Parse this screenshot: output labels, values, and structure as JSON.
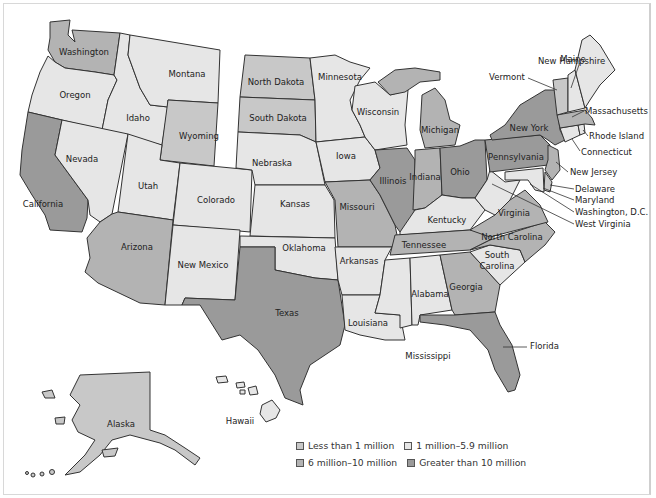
{
  "map": {
    "title": "",
    "colors": {
      "lt1": "#c8c8c8",
      "m1to5": "#e6e6e6",
      "m6to10": "#b3b3b3",
      "gt10": "#9a9a9a",
      "water": "#ffffff",
      "border": "#333333"
    },
    "legend": [
      {
        "key": "lt1",
        "label": "Less than 1 million"
      },
      {
        "key": "m1to5",
        "label": "1 million–5.9 million"
      },
      {
        "key": "m6to10",
        "label": "6 million–10 million"
      },
      {
        "key": "gt10",
        "label": "Greater than 10 million"
      }
    ],
    "states": [
      {
        "name": "Washington",
        "category": "m6to10"
      },
      {
        "name": "Oregon",
        "category": "m1to5"
      },
      {
        "name": "California",
        "category": "gt10"
      },
      {
        "name": "Idaho",
        "category": "m1to5"
      },
      {
        "name": "Nevada",
        "category": "m1to5"
      },
      {
        "name": "Montana",
        "category": "lt1"
      },
      {
        "name": "Wyoming",
        "category": "lt1"
      },
      {
        "name": "Utah",
        "category": "m1to5"
      },
      {
        "name": "Arizona",
        "category": "m6to10"
      },
      {
        "name": "Colorado",
        "category": "m1to5"
      },
      {
        "name": "New Mexico",
        "category": "m1to5"
      },
      {
        "name": "North Dakota",
        "category": "lt1"
      },
      {
        "name": "South Dakota",
        "category": "lt1"
      },
      {
        "name": "Nebraska",
        "category": "m1to5"
      },
      {
        "name": "Kansas",
        "category": "m1to5"
      },
      {
        "name": "Oklahoma",
        "category": "m1to5"
      },
      {
        "name": "Texas",
        "category": "gt10"
      },
      {
        "name": "Minnesota",
        "category": "m1to5"
      },
      {
        "name": "Iowa",
        "category": "m1to5"
      },
      {
        "name": "Missouri",
        "category": "m6to10"
      },
      {
        "name": "Arkansas",
        "category": "m1to5"
      },
      {
        "name": "Louisiana",
        "category": "m1to5"
      },
      {
        "name": "Wisconsin",
        "category": "m1to5"
      },
      {
        "name": "Illinois",
        "category": "gt10"
      },
      {
        "name": "Michigan",
        "category": "m6to10"
      },
      {
        "name": "Indiana",
        "category": "m6to10"
      },
      {
        "name": "Ohio",
        "category": "gt10"
      },
      {
        "name": "Kentucky",
        "category": "m1to5"
      },
      {
        "name": "Tennessee",
        "category": "m6to10"
      },
      {
        "name": "Mississippi",
        "category": "m1to5"
      },
      {
        "name": "Alabama",
        "category": "m1to5"
      },
      {
        "name": "Georgia",
        "category": "m6to10"
      },
      {
        "name": "Florida",
        "category": "gt10"
      },
      {
        "name": "South Carolina",
        "category": "m1to5"
      },
      {
        "name": "North Carolina",
        "category": "m6to10"
      },
      {
        "name": "Virginia",
        "category": "m6to10"
      },
      {
        "name": "West Virginia",
        "category": "m1to5"
      },
      {
        "name": "Pennsylvania",
        "category": "gt10"
      },
      {
        "name": "New York",
        "category": "gt10"
      },
      {
        "name": "New Jersey",
        "category": "m6to10"
      },
      {
        "name": "Delaware",
        "category": "lt1"
      },
      {
        "name": "Maryland",
        "category": "m1to5"
      },
      {
        "name": "Washington, D.C.",
        "category": "lt1"
      },
      {
        "name": "Connecticut",
        "category": "m1to5"
      },
      {
        "name": "Rhode Island",
        "category": "m1to5"
      },
      {
        "name": "Massachusetts",
        "category": "m6to10"
      },
      {
        "name": "Vermont",
        "category": "lt1"
      },
      {
        "name": "New Hampshire",
        "category": "m1to5"
      },
      {
        "name": "Maine",
        "category": "m1to5"
      },
      {
        "name": "Alaska",
        "category": "lt1"
      },
      {
        "name": "Hawaii",
        "category": "m1to5"
      }
    ],
    "labels": {
      "washington": "Washington",
      "oregon": "Oregon",
      "california": "California",
      "idaho": "Idaho",
      "nevada": "Nevada",
      "montana": "Montana",
      "wyoming": "Wyoming",
      "utah": "Utah",
      "arizona": "Arizona",
      "colorado": "Colorado",
      "new_mexico": "New Mexico",
      "north_dakota": "North Dakota",
      "south_dakota": "South Dakota",
      "nebraska": "Nebraska",
      "kansas": "Kansas",
      "oklahoma": "Oklahoma",
      "texas": "Texas",
      "minnesota": "Minnesota",
      "iowa": "Iowa",
      "missouri": "Missouri",
      "arkansas": "Arkansas",
      "louisiana": "Louisiana",
      "wisconsin": "Wisconsin",
      "illinois": "Illinois",
      "michigan": "Michigan",
      "indiana": "Indiana",
      "ohio": "Ohio",
      "kentucky": "Kentucky",
      "tennessee": "Tennessee",
      "mississippi": "Mississippi",
      "alabama": "Alabama",
      "georgia": "Georgia",
      "florida": "Florida",
      "south_carolina_1": "South",
      "south_carolina_2": "Carolina",
      "north_carolina": "North Carolina",
      "virginia": "Virginia",
      "west_virginia": "West Virginia",
      "pennsylvania": "Pennsylvania",
      "new_york": "New York",
      "new_jersey": "New Jersey",
      "delaware": "Delaware",
      "maryland": "Maryland",
      "dc": "Washington, D.C.",
      "connecticut": "Connecticut",
      "rhode_island": "Rhode Island",
      "massachusetts": "Massachusetts",
      "vermont": "Vermont",
      "new_hampshire": "New Hampshire",
      "maine": "Maine",
      "alaska": "Alaska",
      "hawaii": "Hawaii"
    }
  }
}
